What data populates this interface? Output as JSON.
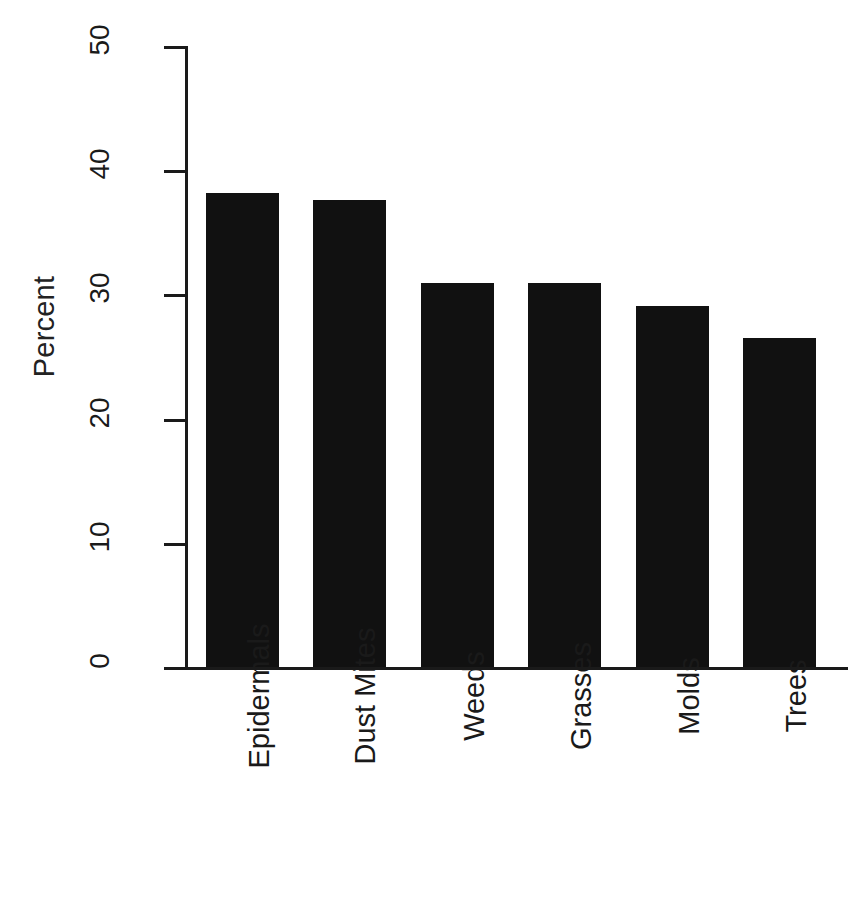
{
  "chart_data": {
    "type": "bar",
    "title": "",
    "subtitle": "",
    "xlabel": "",
    "ylabel": "Percent",
    "categories": [
      "Epidermals",
      "Dust Mites",
      "Weeds",
      "Grasses",
      "Molds",
      "Trees"
    ],
    "values": [
      38.2,
      37.6,
      30.9,
      30.9,
      29.1,
      26.5
    ],
    "ylim": [
      0,
      50
    ],
    "yticks": [
      0,
      10,
      20,
      30,
      40,
      50
    ],
    "ytick_labels": [
      "0",
      "10",
      "20",
      "30",
      "40",
      "50"
    ],
    "grid": false,
    "legend": null,
    "bar_color": "#111111",
    "axis_color": "#1a1a1a",
    "background_color": "#ffffff",
    "orientation": "vertical",
    "annotations": []
  },
  "axis": {
    "y_title": "Percent"
  },
  "style": {
    "bar_color": "#111111",
    "axis_color": "#1a1a1a",
    "background": "#ffffff"
  }
}
